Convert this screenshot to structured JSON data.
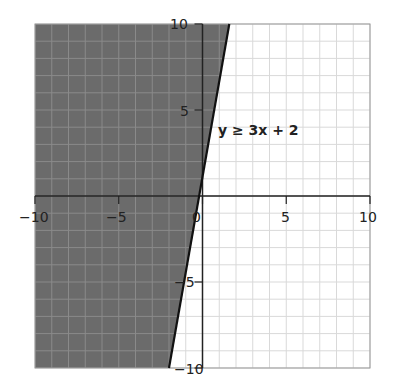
{
  "chart_data": {
    "type": "area",
    "title": "",
    "xlabel": "",
    "ylabel": "",
    "xlim": [
      -10,
      10
    ],
    "ylim": [
      -10,
      10
    ],
    "grid": true,
    "grid_step": 1,
    "x_ticks": [
      -10,
      -5,
      0,
      5,
      10
    ],
    "y_ticks": [
      -10,
      -5,
      5,
      10
    ],
    "x_tick_labels": [
      "−10",
      "−5",
      "0",
      "5",
      "10"
    ],
    "y_tick_labels": [
      "−10",
      "−5",
      "5",
      "10"
    ],
    "boundary_line": {
      "equation": "y = 3x + 2",
      "drawn_points": [
        [
          -2,
          -10
        ],
        [
          1.6,
          10
        ]
      ],
      "style": "solid"
    },
    "shaded_region": "left of boundary line",
    "annotation": {
      "text": "y ≥ 3x + 2",
      "x": 1.2,
      "y": 3.8
    },
    "colors": {
      "shade": "#6b6b6b",
      "grid_light": "#d9d9d9",
      "grid_dark": "#8a8a8a",
      "axis": "#222222",
      "line": "#111111"
    }
  },
  "labels": {
    "equation": "y ≥ 3x + 2",
    "x_ticks": [
      "−10",
      "−5",
      "0",
      "5",
      "10"
    ],
    "y_ticks": [
      "10",
      "5",
      "−5",
      "−10"
    ]
  }
}
